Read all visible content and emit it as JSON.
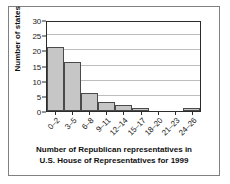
{
  "chart_data": {
    "type": "bar",
    "title": "",
    "subtitle": "",
    "categories": [
      "0–2",
      "3–5",
      "6–8",
      "9–11",
      "12–14",
      "15–17",
      "18–20",
      "21–23",
      "24–26"
    ],
    "values": [
      21,
      16,
      6,
      3,
      2,
      1,
      0,
      0,
      1
    ],
    "xlabel": "Number of Republican representatives in U.S. House of Representatives for 1999",
    "ylabel": "Number of states",
    "ylim": [
      0,
      30
    ],
    "yticks": [
      0,
      5,
      10,
      15,
      20,
      25,
      30
    ],
    "ytick_labels": [
      "0",
      "5",
      "10",
      "15",
      "20",
      "25",
      "30"
    ],
    "grid": "horizontal",
    "legend": "none",
    "bar_color": "#c6c6c6",
    "bar_edge_color": "#4a4a4a",
    "gridline_color": "#bdbdbd",
    "axis_color": "#2b2b2b"
  },
  "axes": {
    "y_title": "Number of states"
  },
  "caption": {
    "line1": "Number of Republican representatives in",
    "line2": "U.S. House of Representatives for 1999"
  }
}
